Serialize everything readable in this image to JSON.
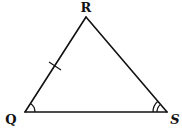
{
  "diagram": {
    "type": "triangle",
    "vertices": [
      {
        "name": "R",
        "label": "R",
        "x": 86,
        "y": 17,
        "label_x": 86,
        "label_y": 12
      },
      {
        "name": "Q",
        "label": "Q",
        "x": 25,
        "y": 112,
        "label_x": 11,
        "label_y": 124
      },
      {
        "name": "S",
        "label": "S",
        "x": 167,
        "y": 112,
        "label_x": 175,
        "label_y": 124
      }
    ],
    "sides": [
      {
        "name": "QR",
        "tick_marks": 1
      },
      {
        "name": "RS",
        "tick_marks": 0
      },
      {
        "name": "QS",
        "tick_marks": 0
      }
    ],
    "angles": [
      {
        "vertex": "Q",
        "arcs": 1
      },
      {
        "vertex": "S",
        "arcs": 2
      }
    ],
    "colors": {
      "stroke": "#111111",
      "background": "#ffffff"
    }
  }
}
